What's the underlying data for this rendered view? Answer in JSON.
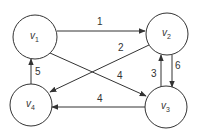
{
  "diagram": {
    "type": "directed-weighted-graph",
    "nodes": [
      {
        "id": "v1",
        "label": "v",
        "sub": "1",
        "cx": 35,
        "cy": 37,
        "r": 22
      },
      {
        "id": "v2",
        "label": "v",
        "sub": "2",
        "cx": 167,
        "cy": 34,
        "r": 21
      },
      {
        "id": "v3",
        "label": "v",
        "sub": "3",
        "cx": 166,
        "cy": 107,
        "r": 21
      },
      {
        "id": "v4",
        "label": "v",
        "sub": "4",
        "cx": 31,
        "cy": 105,
        "r": 21
      }
    ],
    "edges": [
      {
        "from": "v1",
        "to": "v2",
        "weight": "1",
        "x1": 57,
        "y1": 31,
        "x2": 145,
        "y2": 31,
        "lx": 97,
        "ly": 25
      },
      {
        "from": "v2",
        "to": "v4",
        "weight": "2",
        "x1": 149,
        "y1": 45,
        "x2": 50,
        "y2": 92,
        "lx": 118,
        "ly": 51
      },
      {
        "from": "v1",
        "to": "v3",
        "weight": "4",
        "x1": 50,
        "y1": 53,
        "x2": 146,
        "y2": 96,
        "lx": 117,
        "ly": 79
      },
      {
        "from": "v3",
        "to": "v2",
        "weight": "3",
        "x1": 161,
        "y1": 87,
        "x2": 161,
        "y2": 55,
        "lx": 151,
        "ly": 77
      },
      {
        "from": "v2",
        "to": "v3",
        "weight": "6",
        "x1": 172,
        "y1": 55,
        "x2": 172,
        "y2": 87,
        "lx": 175,
        "ly": 69
      },
      {
        "from": "v3",
        "to": "v4",
        "weight": "4",
        "x1": 145,
        "y1": 107,
        "x2": 52,
        "y2": 107,
        "lx": 97,
        "ly": 102
      },
      {
        "from": "v4",
        "to": "v1",
        "weight": "5",
        "x1": 31,
        "y1": 84,
        "x2": 31,
        "y2": 59,
        "lx": 35,
        "ly": 75
      }
    ]
  }
}
